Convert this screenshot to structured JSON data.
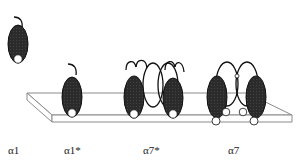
{
  "diagram": {
    "type": "receptor-subunit-membrane-schematic",
    "colors": {
      "subunit_fill": "#2b2b2b",
      "outline": "#111111",
      "membrane_line": "#8a8a8a",
      "background": "#ffffff"
    },
    "labels": [
      {
        "id": "a1",
        "text": "α1",
        "x": 8
      },
      {
        "id": "a1star",
        "text": "α1*",
        "x": 64
      },
      {
        "id": "a7star",
        "text": "α7*",
        "x": 143
      },
      {
        "id": "a7",
        "text": "α7",
        "x": 228
      }
    ],
    "constructs": [
      {
        "name": "α1",
        "position": "free (above membrane)",
        "subunits": 1,
        "loops": 0
      },
      {
        "name": "α1*",
        "position": "inserted in membrane",
        "subunits": 1,
        "loops": 0
      },
      {
        "name": "α7*",
        "position": "inserted in membrane",
        "subunits": 2,
        "loops": 2
      },
      {
        "name": "α7",
        "position": "inserted in membrane",
        "subunits": 2,
        "loops": 2,
        "extra_open_circles": 4
      }
    ]
  }
}
